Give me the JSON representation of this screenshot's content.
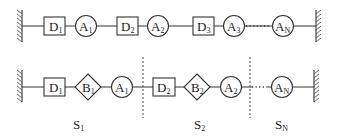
{
  "top_chain": {
    "elements": [
      {
        "type": "box",
        "letter": "D",
        "sub": "1"
      },
      {
        "type": "circle",
        "letter": "A",
        "sub": "1"
      },
      {
        "type": "box",
        "letter": "D",
        "sub": "2"
      },
      {
        "type": "circle",
        "letter": "A",
        "sub": "2"
      },
      {
        "type": "box",
        "letter": "D",
        "sub": "3"
      },
      {
        "type": "circle",
        "letter": "A",
        "sub": "3"
      },
      {
        "type": "ellipsis",
        "letter": "",
        "sub": ""
      },
      {
        "type": "circle",
        "letter": "A",
        "sub": "N"
      }
    ]
  },
  "bottom_chain": {
    "elements": [
      {
        "type": "box",
        "letter": "D",
        "sub": "1"
      },
      {
        "type": "diamond",
        "letter": "B",
        "sub": "1"
      },
      {
        "type": "circle",
        "letter": "A",
        "sub": "1"
      },
      {
        "type": "box",
        "letter": "D",
        "sub": "2"
      },
      {
        "type": "diamond",
        "letter": "B",
        "sub": "2"
      },
      {
        "type": "circle",
        "letter": "A",
        "sub": "2"
      },
      {
        "type": "ellipsis",
        "letter": "",
        "sub": ""
      },
      {
        "type": "circle",
        "letter": "A",
        "sub": "N"
      }
    ],
    "segments": [
      {
        "letter": "S",
        "sub": "1"
      },
      {
        "letter": "S",
        "sub": "2"
      },
      {
        "letter": "S",
        "sub": "N"
      }
    ]
  }
}
